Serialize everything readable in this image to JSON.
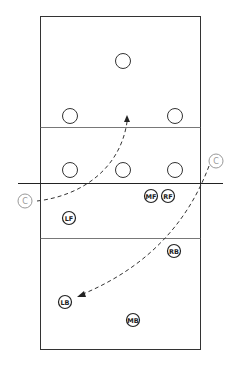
{
  "diagram": {
    "colors": {
      "line": "#333333",
      "faint": "#999999",
      "background": "#ffffff"
    },
    "court": {
      "x": 40,
      "y": 16,
      "width": 161,
      "height": 334,
      "net_y": 183,
      "attack_line_top_y": 127,
      "attack_line_bottom_y": 238
    },
    "opponents": [
      {
        "x": 123,
        "y": 61
      },
      {
        "x": 70,
        "y": 116
      },
      {
        "x": 175,
        "y": 116
      },
      {
        "x": 70,
        "y": 170
      },
      {
        "x": 123,
        "y": 170
      },
      {
        "x": 175,
        "y": 170
      }
    ],
    "players": [
      {
        "label": "MF",
        "x": 151,
        "y": 196
      },
      {
        "label": "RF",
        "x": 168,
        "y": 196
      },
      {
        "label": "LF",
        "x": 69,
        "y": 218
      },
      {
        "label": "RB",
        "x": 174,
        "y": 251
      },
      {
        "label": "LB",
        "x": 65,
        "y": 302
      },
      {
        "label": "MB",
        "x": 133,
        "y": 320
      }
    ],
    "coaches": [
      {
        "label": "C",
        "x": 25,
        "y": 201
      },
      {
        "label": "C",
        "x": 216,
        "y": 161
      }
    ]
  }
}
